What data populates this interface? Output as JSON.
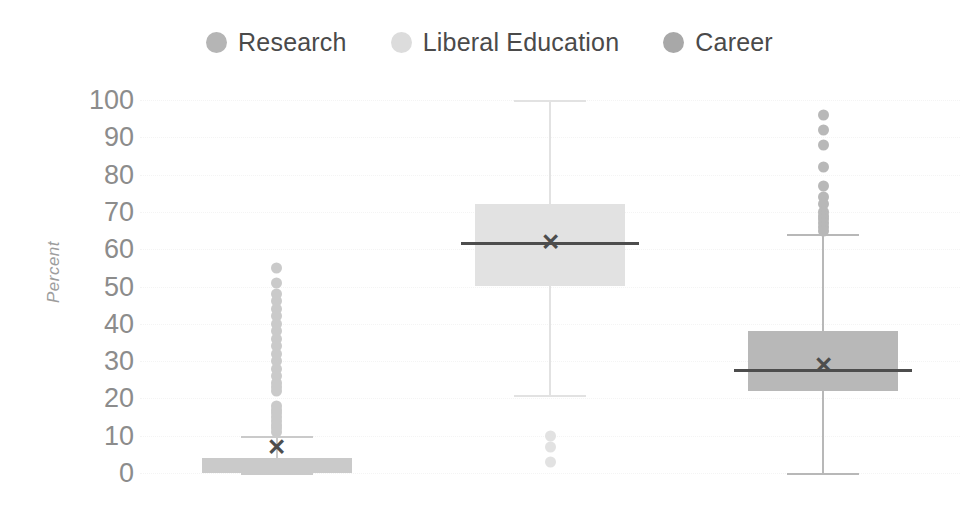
{
  "chart_data": {
    "type": "box",
    "title": "",
    "xlabel": "",
    "ylabel": "Percent",
    "ylim": [
      0,
      100
    ],
    "ytick_labels": [
      "100",
      "90",
      "80",
      "70",
      "60",
      "50",
      "40",
      "30",
      "20",
      "10",
      "0"
    ],
    "ytick_values": [
      100,
      90,
      80,
      70,
      60,
      50,
      40,
      30,
      20,
      10,
      0
    ],
    "grid": true,
    "legend_position": "top-center",
    "categories": [
      "Research",
      "Liberal Education",
      "Career"
    ],
    "series": [
      {
        "name": "Research",
        "color": "#cacaca",
        "legend_color": "#b5b5b5",
        "whisker_low": 0,
        "q1": 0,
        "median": 0,
        "q3": 4,
        "whisker_high": 10,
        "mean": 7,
        "outliers": [
          55,
          51,
          48,
          46,
          44,
          42,
          40,
          38,
          36,
          34,
          32,
          30,
          28,
          26,
          24,
          23,
          22,
          18,
          17,
          16,
          15,
          14,
          13,
          12,
          11
        ]
      },
      {
        "name": "Liberal Education",
        "color": "#e2e2e2",
        "legend_color": "#dcdcdc",
        "whisker_low": 21,
        "q1": 50,
        "median": 62,
        "q3": 72,
        "whisker_high": 100,
        "mean": 62,
        "outliers": [
          10,
          7,
          3
        ]
      },
      {
        "name": "Career",
        "color": "#b8b8b8",
        "legend_color": "#a8a8a8",
        "whisker_low": 0,
        "q1": 22,
        "median": 28,
        "q3": 38,
        "whisker_high": 64,
        "mean": 29,
        "outliers": [
          96,
          92,
          88,
          82,
          77,
          74,
          72,
          70,
          69,
          68,
          67,
          66,
          65
        ]
      }
    ]
  },
  "legend": {
    "items": [
      {
        "label": "Research",
        "swatch": "legend-swatch-research"
      },
      {
        "label": "Liberal Education",
        "swatch": "legend-swatch-liberal-education"
      },
      {
        "label": "Career",
        "swatch": "legend-swatch-career"
      }
    ]
  },
  "axis": {
    "y_title": "Percent"
  },
  "colors": {
    "text": "#4a4a4a",
    "tick_text": "#8c8c8c",
    "axis_title": "#9d9d9d",
    "gridline": "#f4f4f4",
    "median": "#4d4d4d",
    "background": "#ffffff"
  }
}
